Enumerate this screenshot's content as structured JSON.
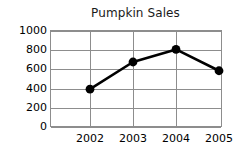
{
  "chart_data": {
    "type": "line",
    "title": "Pumpkin Sales",
    "xlabel": "",
    "ylabel": "",
    "categories": [
      "2002",
      "2003",
      "2004",
      "2005"
    ],
    "values": [
      390,
      670,
      800,
      580
    ],
    "series": [
      {
        "name": "Pumpkin Sales",
        "values": [
          390,
          670,
          800,
          580
        ]
      }
    ],
    "ylim": [
      0,
      1000
    ],
    "ytick_labels": [
      "1000",
      "800",
      "600",
      "400",
      "200",
      "0"
    ],
    "ytick_values": [
      1000,
      800,
      600,
      400,
      200,
      0
    ],
    "xtick_labels": [
      "2002",
      "2003",
      "2004",
      "2005"
    ],
    "grid": true,
    "legend": "none",
    "colors": {
      "line": "#000000",
      "marker": "#000000",
      "grid": "#8d8d8d",
      "axis": "#8d8d8d",
      "text": "#000000",
      "background": "#ffffff"
    }
  }
}
